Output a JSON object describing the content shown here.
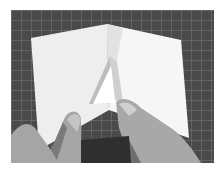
{
  "image": {
    "description": "Black-and-white photo of two hands folding a sheet of white paper, forming a triangular pocket fold, on a dark gridded cutting mat",
    "subject": "paper folding",
    "colors": {
      "mat": "#4a4a4a",
      "grid": "#8a8a8a",
      "paper_light": "#f2f2f2",
      "paper_shadow": "#d6d6d6",
      "skin": "#a9a9a9",
      "skin_shadow": "#6e6e6e"
    }
  }
}
